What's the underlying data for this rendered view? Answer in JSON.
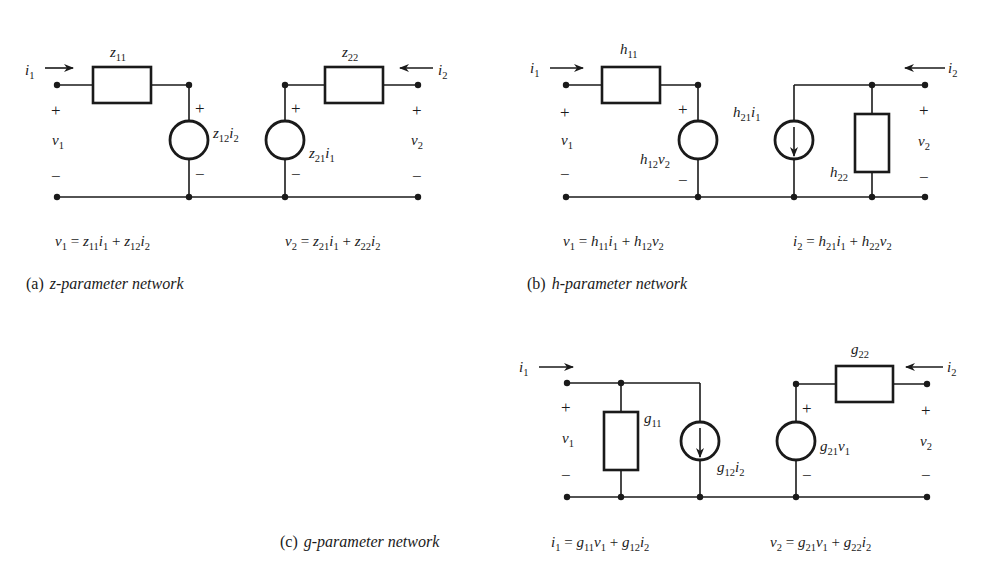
{
  "figure": {
    "colors": {
      "ink": "#1a1a1a",
      "background": "#ffffff"
    },
    "panels": [
      {
        "id": "a",
        "caption_tag": "(a)",
        "caption_text": "z-parameter network",
        "series_element": {
          "symbol": "z",
          "sub": "11",
          "type": "impedance"
        },
        "shunt_left": {
          "symbol": "z",
          "sub": "12",
          "ctrl": "i",
          "ctrl_sub": "2",
          "type": "voltage-source",
          "polarity": [
            "+",
            "−"
          ]
        },
        "shunt_right": {
          "symbol": "z",
          "sub": "21",
          "ctrl": "i",
          "ctrl_sub": "1",
          "type": "voltage-source",
          "polarity": [
            "+",
            "−"
          ]
        },
        "series_right": {
          "symbol": "z",
          "sub": "22",
          "type": "impedance"
        },
        "port1": {
          "current": "i",
          "current_sub": "1",
          "voltage": "v",
          "voltage_sub": "1",
          "plus": "+",
          "minus": "−"
        },
        "port2": {
          "current": "i",
          "current_sub": "2",
          "voltage": "v",
          "voltage_sub": "2",
          "plus": "+",
          "minus": "−"
        },
        "equations": [
          "v1 = z11 i1 + z12 i2",
          "v2 = z21 i1 + z22 i2"
        ]
      },
      {
        "id": "b",
        "caption_tag": "(b)",
        "caption_text": "h-parameter network",
        "series_element": {
          "symbol": "h",
          "sub": "11",
          "type": "impedance"
        },
        "shunt_left": {
          "symbol": "h",
          "sub": "12",
          "ctrl": "v",
          "ctrl_sub": "2",
          "type": "voltage-source",
          "polarity": [
            "+",
            "−"
          ]
        },
        "shunt_right": {
          "symbol": "h",
          "sub": "21",
          "ctrl": "i",
          "ctrl_sub": "1",
          "type": "current-source"
        },
        "shunt_admittance": {
          "symbol": "h",
          "sub": "22",
          "type": "admittance"
        },
        "port1": {
          "current": "i",
          "current_sub": "1",
          "voltage": "v",
          "voltage_sub": "1",
          "plus": "+",
          "minus": "−"
        },
        "port2": {
          "current": "i",
          "current_sub": "2",
          "voltage": "v",
          "voltage_sub": "2",
          "plus": "+",
          "minus": "−"
        },
        "equations": [
          "v1 = h11 i1 + h12 v2",
          "i2 = h21 i1 + h22 v2"
        ]
      },
      {
        "id": "c",
        "caption_tag": "(c)",
        "caption_text": "g-parameter network",
        "shunt_admittance": {
          "symbol": "g",
          "sub": "11",
          "type": "admittance"
        },
        "shunt_left": {
          "symbol": "g",
          "sub": "12",
          "ctrl": "i",
          "ctrl_sub": "2",
          "type": "current-source"
        },
        "shunt_right": {
          "symbol": "g",
          "sub": "21",
          "ctrl": "v",
          "ctrl_sub": "1",
          "type": "voltage-source",
          "polarity": [
            "+",
            "−"
          ]
        },
        "series_right": {
          "symbol": "g",
          "sub": "22",
          "type": "impedance"
        },
        "port1": {
          "current": "i",
          "current_sub": "1",
          "voltage": "v",
          "voltage_sub": "1",
          "plus": "+",
          "minus": "−"
        },
        "port2": {
          "current": "i",
          "current_sub": "2",
          "voltage": "v",
          "voltage_sub": "2",
          "plus": "+",
          "minus": "−"
        },
        "equations": [
          "i1 = g11 v1 + g12 i2",
          "v2 = g21 v1 + g22 i2"
        ]
      }
    ],
    "eq_parts": {
      "eq": "=",
      "plus": "+"
    }
  }
}
